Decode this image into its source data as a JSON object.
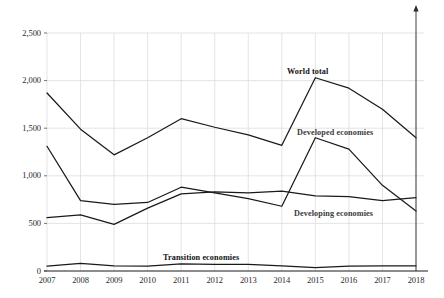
{
  "chart_data": {
    "type": "line",
    "title": "",
    "xlabel": "",
    "ylabel": "",
    "categories": [
      "2007",
      "2008",
      "2009",
      "2010",
      "2011",
      "2012",
      "2013",
      "2014",
      "2015",
      "2016",
      "2017",
      "2018"
    ],
    "x": [
      2007,
      2008,
      2009,
      2010,
      2011,
      2012,
      2013,
      2014,
      2015,
      2016,
      2017,
      2018
    ],
    "ylim": [
      0,
      2500
    ],
    "yticks": [
      0,
      500,
      1000,
      1500,
      2000,
      2500
    ],
    "ytick_labels": [
      "0",
      "500",
      "1,000",
      "1,500",
      "2,000",
      "2,500"
    ],
    "grid": true,
    "legend": "inline-annotations",
    "series": [
      {
        "name": "World total",
        "label": "World total",
        "color": "#1a1a1a",
        "values": [
          1870,
          1490,
          1220,
          1400,
          1600,
          1510,
          1430,
          1320,
          2030,
          1920,
          1700,
          1400
        ]
      },
      {
        "name": "Developed economies",
        "label": "Developed economies",
        "color": "#1a1a1a",
        "values": [
          1310,
          740,
          700,
          720,
          880,
          820,
          760,
          680,
          1400,
          1280,
          900,
          630
        ]
      },
      {
        "name": "Developing economies",
        "label": "Developing economies",
        "color": "#1a1a1a",
        "values": [
          560,
          590,
          490,
          660,
          810,
          830,
          820,
          840,
          790,
          780,
          740,
          770
        ]
      },
      {
        "name": "Transition economies",
        "label": "Transition economies",
        "color": "#1a1a1a",
        "values": [
          50,
          80,
          55,
          50,
          75,
          70,
          70,
          55,
          35,
          50,
          55,
          55
        ]
      }
    ],
    "annotations": [
      {
        "text": "World total",
        "x_px": 287,
        "y_px": 67
      },
      {
        "text": "Developed economies",
        "x_px": 297,
        "y_px": 128
      },
      {
        "text": "Developing economies",
        "x_px": 294,
        "y_px": 209
      },
      {
        "text": "Transition economies",
        "x_px": 163,
        "y_px": 253
      }
    ],
    "axes": {
      "x_axis_color": "#1a1a1a",
      "grid_color": "#d8d8d8",
      "vertical_marker_year": 2018,
      "vertical_marker_has_arrow": true
    }
  }
}
